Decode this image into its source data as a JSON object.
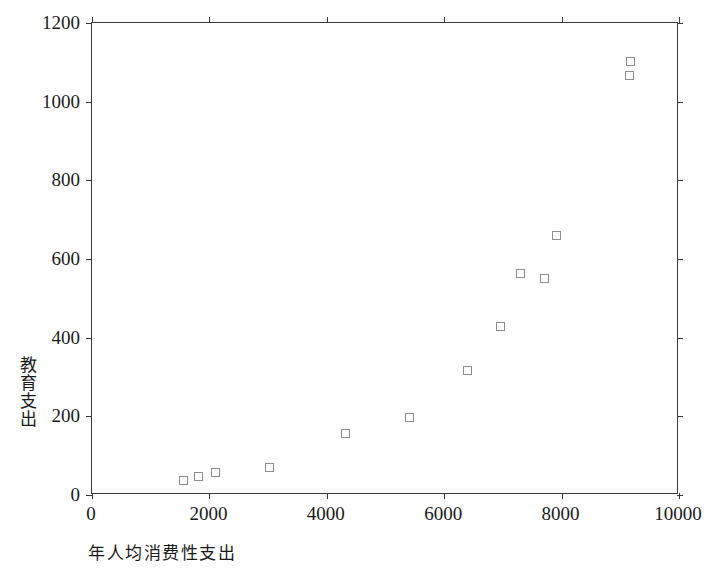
{
  "chart_data": {
    "type": "scatter",
    "title": "",
    "xlabel": "年人均消费性支出",
    "ylabel": "教育支出",
    "xlim": [
      0,
      10000
    ],
    "ylim": [
      0,
      1200
    ],
    "xticks": [
      0,
      2000,
      4000,
      6000,
      8000,
      10000
    ],
    "yticks": [
      0,
      200,
      400,
      600,
      800,
      1000,
      1200
    ],
    "xtick_labels": [
      "0",
      "2000",
      "4000",
      "6000",
      "8000",
      "10000"
    ],
    "ytick_labels": [
      "0",
      "200",
      "400",
      "600",
      "800",
      "1000",
      "1200"
    ],
    "grid": false,
    "legend": false,
    "marker": "open-square",
    "marker_color": "#8d8d92",
    "axis_color": "#3a3a3a",
    "background": "#ffffff",
    "series": [
      {
        "name": "教育支出",
        "points": [
          {
            "x": 1570,
            "y": 31
          },
          {
            "x": 1825,
            "y": 41
          },
          {
            "x": 2110,
            "y": 53
          },
          {
            "x": 3030,
            "y": 66
          },
          {
            "x": 4340,
            "y": 152
          },
          {
            "x": 5430,
            "y": 194
          },
          {
            "x": 6420,
            "y": 312
          },
          {
            "x": 6990,
            "y": 425
          },
          {
            "x": 7320,
            "y": 560
          },
          {
            "x": 7740,
            "y": 548
          },
          {
            "x": 7940,
            "y": 657
          },
          {
            "x": 9195,
            "y": 1066
          },
          {
            "x": 9210,
            "y": 1101
          }
        ]
      }
    ]
  }
}
